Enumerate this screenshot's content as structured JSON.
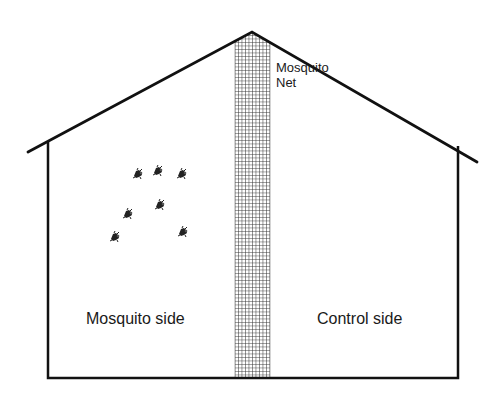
{
  "diagram": {
    "type": "house-cross-section",
    "labels": {
      "net": [
        "Mosquito",
        "Net"
      ],
      "left_side": "Mosquito side",
      "right_side": "Control side"
    },
    "colors": {
      "line": "#111111",
      "background": "#ffffff",
      "net_grid": "#333333",
      "mosquito": "#222222"
    },
    "house": {
      "apex": [
        252,
        32
      ],
      "left_eave": [
        28,
        152
      ],
      "right_eave": [
        477,
        162
      ],
      "left_wall_x": 48,
      "right_wall_x": 458,
      "floor_y": 378
    },
    "net": {
      "x": 235,
      "width": 35
    },
    "mosquitoes": [
      {
        "x": 138,
        "y": 174
      },
      {
        "x": 158,
        "y": 171
      },
      {
        "x": 182,
        "y": 174
      },
      {
        "x": 128,
        "y": 214
      },
      {
        "x": 160,
        "y": 205
      },
      {
        "x": 115,
        "y": 237
      },
      {
        "x": 183,
        "y": 232
      }
    ]
  }
}
